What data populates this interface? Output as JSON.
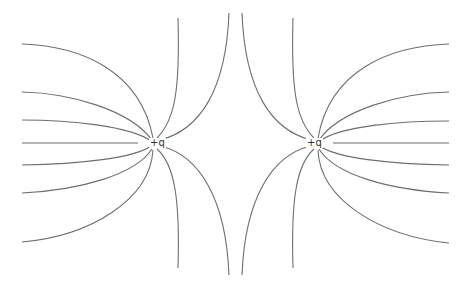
{
  "diagram": {
    "line_color": "#6e6e6e",
    "charges": [
      {
        "id": "left",
        "label": "+q",
        "x": 155,
        "y": 143,
        "label_x": 149,
        "label_y": 138
      },
      {
        "id": "right",
        "label": "+q",
        "x": 318,
        "y": 143,
        "label_x": 306,
        "label_y": 138
      }
    ],
    "field_lines": [
      {
        "charge": "left",
        "d": "M22,44 C80,46 140,70 153,138"
      },
      {
        "charge": "left",
        "d": "M22,92 C70,93 130,110 152,140"
      },
      {
        "charge": "left",
        "d": "M22,120 C70,120 130,126 151,141"
      },
      {
        "charge": "left",
        "d": "M22,143 L138,143"
      },
      {
        "charge": "left",
        "d": "M22,165 C80,164 135,158 151,146"
      },
      {
        "charge": "left",
        "d": "M22,193 C80,190 135,175 152,149"
      },
      {
        "charge": "left",
        "d": "M22,242 C90,236 150,200 153,150"
      },
      {
        "charge": "left",
        "d": "M178,18 C180,90 175,120 157,138"
      },
      {
        "charge": "left",
        "d": "M229,13 C226,90 200,130 160,140"
      },
      {
        "charge": "left",
        "d": "M178,268 C180,200 175,165 157,149"
      },
      {
        "charge": "left",
        "d": "M229,275 C226,200 200,155 160,146"
      },
      {
        "charge": "right",
        "d": "M449,44 C390,46 330,70 318,138"
      },
      {
        "charge": "right",
        "d": "M449,92 C400,93 340,110 319,140"
      },
      {
        "charge": "right",
        "d": "M449,121 C400,121 340,126 320,141"
      },
      {
        "charge": "right",
        "d": "M449,143 L333,143"
      },
      {
        "charge": "right",
        "d": "M449,165 C390,164 335,158 320,146"
      },
      {
        "charge": "right",
        "d": "M449,193 C390,190 335,175 319,149"
      },
      {
        "charge": "right",
        "d": "M449,243 C380,236 320,200 318,150"
      },
      {
        "charge": "right",
        "d": "M293,18 C291,90 296,120 314,138"
      },
      {
        "charge": "right",
        "d": "M242,13 C245,90 271,130 311,140"
      },
      {
        "charge": "right",
        "d": "M293,268 C291,200 296,165 314,149"
      },
      {
        "charge": "right",
        "d": "M242,275 C245,200 271,155 311,146"
      }
    ]
  }
}
